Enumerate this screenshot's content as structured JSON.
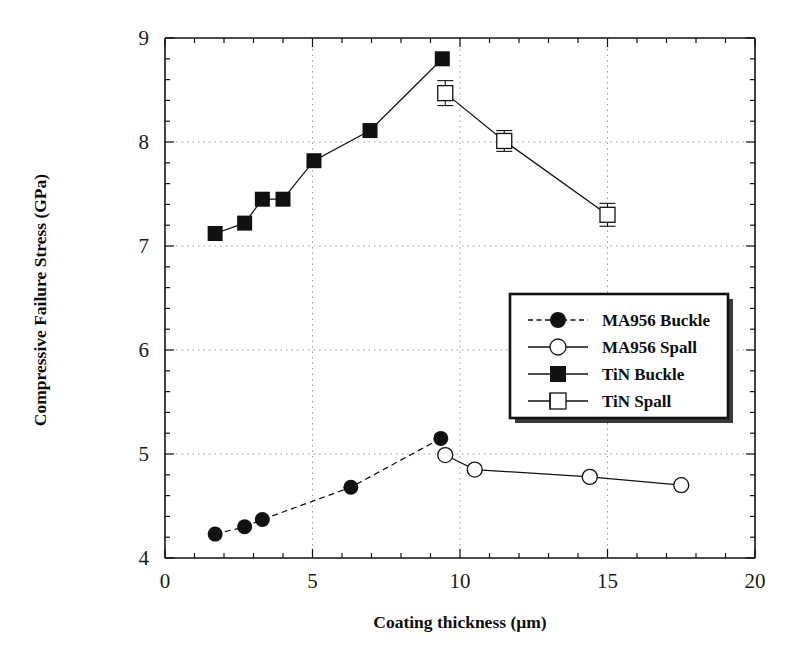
{
  "chart_data": {
    "type": "scatter",
    "title": "",
    "xlabel": "Coating thickness (µm)",
    "ylabel": "Compressive Failure Stress (GPa)",
    "xlim": [
      0,
      20
    ],
    "ylim": [
      4,
      9
    ],
    "xticks": [
      0,
      5,
      10,
      15,
      20
    ],
    "xtick_labels": [
      "0",
      "5",
      "10",
      "15",
      "20"
    ],
    "yticks": [
      4,
      5,
      6,
      7,
      8,
      9
    ],
    "ytick_labels": [
      "4",
      "5",
      "6",
      "7",
      "8",
      "9"
    ],
    "x_minor_tick_interval": 1,
    "y_minor_tick_interval": 0.2,
    "grid": "dotted",
    "grid_x_values": [
      5,
      10,
      15
    ],
    "grid_y_values": [
      5,
      6,
      7,
      8
    ],
    "legend_position": "center-right",
    "series": [
      {
        "name": "MA956 Buckle",
        "marker": "filled-circle",
        "line": "dashed",
        "x": [
          1.7,
          2.7,
          3.3,
          6.3,
          9.35
        ],
        "y": [
          4.23,
          4.3,
          4.37,
          4.68,
          5.15
        ]
      },
      {
        "name": "MA956 Spall",
        "marker": "open-circle",
        "line": "solid",
        "x": [
          9.5,
          10.5,
          14.4,
          17.5
        ],
        "y": [
          4.99,
          4.85,
          4.78,
          4.7
        ]
      },
      {
        "name": "TiN Buckle",
        "marker": "filled-square",
        "line": "solid",
        "x": [
          1.7,
          2.7,
          3.3,
          4.0,
          5.05,
          6.95,
          9.4
        ],
        "y": [
          7.12,
          7.22,
          7.45,
          7.45,
          7.82,
          8.11,
          8.8
        ]
      },
      {
        "name": "TiN Spall",
        "marker": "open-square-errorbar",
        "line": "solid",
        "x": [
          9.5,
          11.5,
          15.0
        ],
        "y": [
          8.47,
          8.01,
          7.3
        ],
        "yerr": [
          0.12,
          0.1,
          0.11
        ]
      }
    ]
  },
  "legend": {
    "items": [
      {
        "label": "MA956 Buckle",
        "marker": "filled-circle",
        "line": "dashed"
      },
      {
        "label": "MA956 Spall",
        "marker": "open-circle",
        "line": "solid"
      },
      {
        "label": "TiN Buckle",
        "marker": "filled-square",
        "line": "solid"
      },
      {
        "label": "TiN Spall",
        "marker": "open-square-errorbar",
        "line": "solid"
      }
    ]
  },
  "colors": {
    "ink": "#111111",
    "grid": "#9a9a9a",
    "background": "#ffffff"
  }
}
